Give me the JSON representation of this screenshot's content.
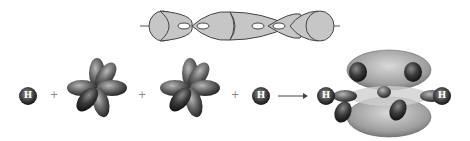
{
  "diagram": {
    "type": "orbital-overlap",
    "sigma_bond_row": {
      "description": "sigma bond framework: H-C-C-H overlapping hybrid orbitals along axis",
      "fill_color": "#c8c8c8",
      "stroke_color": "#444444"
    },
    "reaction_row": {
      "items": [
        {
          "kind": "atom",
          "label": "H"
        },
        {
          "kind": "operator",
          "label": "+"
        },
        {
          "kind": "carbon-orbitals"
        },
        {
          "kind": "operator",
          "label": "+"
        },
        {
          "kind": "carbon-orbitals"
        },
        {
          "kind": "operator",
          "label": "+"
        },
        {
          "kind": "atom",
          "label": "H"
        },
        {
          "kind": "arrow",
          "label": "→"
        },
        {
          "kind": "molecule",
          "left_atom": "H",
          "right_atom": "H"
        }
      ]
    },
    "colors": {
      "lobe_dark": "#2a2a2a",
      "lobe_mid": "#6a6a6a",
      "lobe_light": "#b0b0b0",
      "pi_cloud": "#9a9a9a"
    },
    "labels": {
      "h1": "H",
      "plus1": "+",
      "plus2": "+",
      "plus3": "+",
      "h2": "H",
      "h_left": "H",
      "h_right": "H"
    }
  }
}
